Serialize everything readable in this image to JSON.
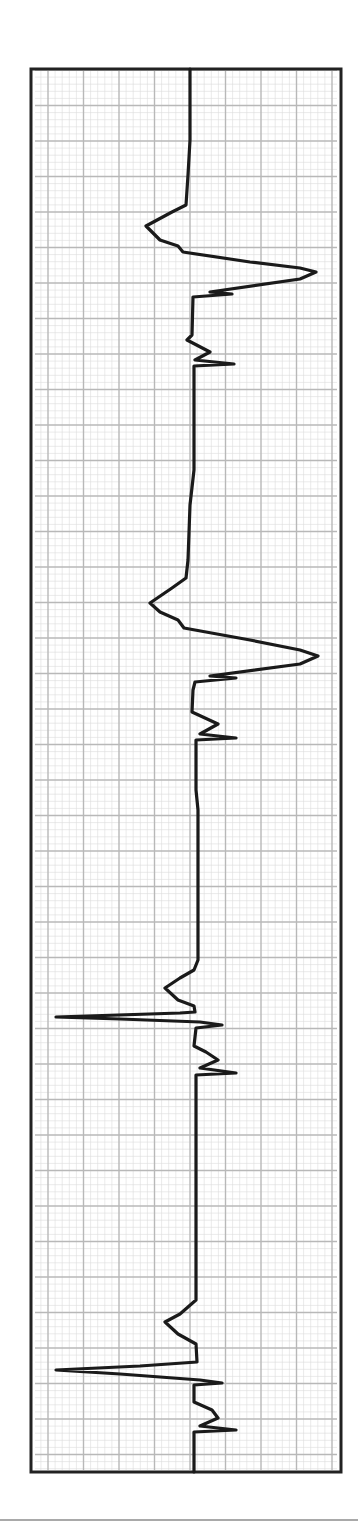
{
  "chart_data": {
    "type": "line",
    "title": "",
    "xlabel": "",
    "ylabel": "",
    "grid": true,
    "orientation": "vertical",
    "frame": {
      "x": 31,
      "y": 69,
      "width": 310,
      "height": 1403
    },
    "grid_spec": {
      "minor_px": 7.1,
      "major_px": 35.5,
      "origin_x": 48,
      "origin_y": 70
    },
    "colors": {
      "trace": "#1a1a1a",
      "frame": "#222222",
      "grid_major": "#b8b8b8",
      "grid_minor": "#dcdcdc",
      "background": "#ffffff",
      "footer_rule": "#555555"
    },
    "complexes": [
      {
        "index": 1,
        "morphology": "wide upright (rightward) complex with preceding leftward P-like deflection",
        "onset_y": 205,
        "peak_y": 272,
        "peak_x": 316,
        "trough_x": 146,
        "secondary_notches_y": [
          296,
          363
        ]
      },
      {
        "index": 2,
        "morphology": "wide upright (rightward) complex with preceding leftward P-like deflection",
        "onset_y": 575,
        "peak_y": 630,
        "peak_x": 318,
        "trough_x": 149,
        "secondary_notches_y": [
          647,
          718
        ]
      },
      {
        "index": 3,
        "morphology": "narrow sharp leftward spike preceded by small leftward P wave",
        "onset_y": 975,
        "peak_y": 1017,
        "peak_x": 56,
        "trough_x": 165,
        "secondary_notches_y": [
          1025,
          1073
        ]
      },
      {
        "index": 4,
        "morphology": "narrow sharp leftward spike preceded by small leftward P wave",
        "onset_y": 1330,
        "peak_y": 1370,
        "peak_x": 56,
        "trough_x": 165,
        "secondary_notches_y": [
          1382,
          1430
        ]
      }
    ],
    "trace_points": [
      [
        190,
        69
      ],
      [
        190,
        140
      ],
      [
        188,
        175
      ],
      [
        186,
        205
      ],
      [
        172,
        212
      ],
      [
        146,
        226
      ],
      [
        160,
        240
      ],
      [
        178,
        246
      ],
      [
        183,
        252
      ],
      [
        250,
        262
      ],
      [
        300,
        268
      ],
      [
        316,
        272
      ],
      [
        300,
        279
      ],
      [
        210,
        292
      ],
      [
        232,
        294
      ],
      [
        193,
        297
      ],
      [
        192,
        335
      ],
      [
        187,
        340
      ],
      [
        210,
        352
      ],
      [
        195,
        360
      ],
      [
        234,
        364
      ],
      [
        194,
        366
      ],
      [
        194,
        470
      ],
      [
        190,
        505
      ],
      [
        188,
        560
      ],
      [
        186,
        578
      ],
      [
        172,
        588
      ],
      [
        150,
        603
      ],
      [
        160,
        612
      ],
      [
        178,
        620
      ],
      [
        184,
        628
      ],
      [
        250,
        640
      ],
      [
        300,
        650
      ],
      [
        318,
        656
      ],
      [
        300,
        664
      ],
      [
        210,
        676
      ],
      [
        236,
        678
      ],
      [
        195,
        682
      ],
      [
        193,
        690
      ],
      [
        192,
        712
      ],
      [
        218,
        724
      ],
      [
        200,
        734
      ],
      [
        236,
        738
      ],
      [
        196,
        740
      ],
      [
        196,
        790
      ],
      [
        198,
        810
      ],
      [
        198,
        960
      ],
      [
        194,
        970
      ],
      [
        180,
        978
      ],
      [
        165,
        988
      ],
      [
        178,
        1000
      ],
      [
        194,
        1006
      ],
      [
        195,
        1012
      ],
      [
        180,
        1013
      ],
      [
        56,
        1017
      ],
      [
        120,
        1019
      ],
      [
        200,
        1022
      ],
      [
        222,
        1025
      ],
      [
        196,
        1028
      ],
      [
        194,
        1046
      ],
      [
        206,
        1052
      ],
      [
        218,
        1060
      ],
      [
        200,
        1068
      ],
      [
        236,
        1073
      ],
      [
        196,
        1075
      ],
      [
        196,
        1300
      ],
      [
        180,
        1314
      ],
      [
        165,
        1322
      ],
      [
        178,
        1334
      ],
      [
        196,
        1344
      ],
      [
        197,
        1362
      ],
      [
        140,
        1366
      ],
      [
        56,
        1370
      ],
      [
        120,
        1374
      ],
      [
        200,
        1380
      ],
      [
        222,
        1383
      ],
      [
        194,
        1385
      ],
      [
        194,
        1402
      ],
      [
        212,
        1410
      ],
      [
        218,
        1418
      ],
      [
        200,
        1426
      ],
      [
        236,
        1430
      ],
      [
        194,
        1432
      ],
      [
        194,
        1472
      ]
    ]
  }
}
